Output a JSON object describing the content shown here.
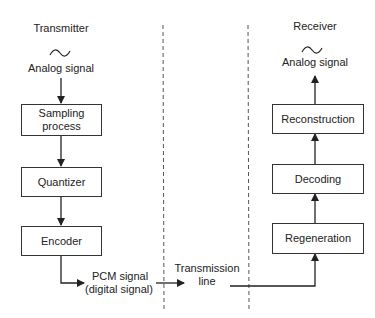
{
  "transmitter": {
    "title": "Transmitter",
    "input_label": "Analog signal",
    "input_icon": "sine-wave-icon",
    "blocks": [
      "Sampling process",
      "Quantizer",
      "Encoder"
    ],
    "output_label_line1": "PCM signal",
    "output_label_line2": "(digital signal)"
  },
  "channel": {
    "label_line1": "Transmission",
    "label_line2": "line"
  },
  "receiver": {
    "title": "Receiver",
    "output_label": "Analog signal",
    "output_icon": "sine-wave-icon",
    "blocks": [
      "Regeneration",
      "Decoding",
      "Reconstruction"
    ]
  },
  "colors": {
    "line": "#222222",
    "background": "#ffffff"
  }
}
